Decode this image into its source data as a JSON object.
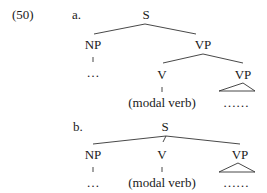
{
  "example": {
    "number": "(50)",
    "tree_a": {
      "label": "a.",
      "root": "S",
      "np": "NP",
      "np_child": "…",
      "vp": "VP",
      "v": "V",
      "v_child": "(modal verb)",
      "vp2": "VP",
      "vp2_child": "……"
    },
    "tree_b": {
      "label": "b.",
      "root": "S",
      "np": "NP",
      "np_child": "…",
      "v": "V",
      "v_child": "(modal verb)",
      "vp": "VP",
      "vp_child": "……"
    }
  }
}
